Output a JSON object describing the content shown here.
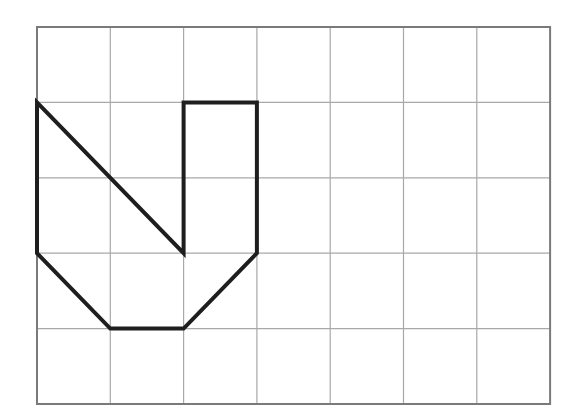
{
  "grid": {
    "columns": 7,
    "rows": 5,
    "origin_px": [
      37,
      27
    ],
    "cell_w": 73.3,
    "cell_h": 75.4,
    "line_color": "#a8a8a8",
    "border_color": "#7a7a7a"
  },
  "shape": {
    "name": "polygon",
    "stroke_color": "#1e1e1e",
    "stroke_width": 4,
    "vertices_grid": [
      [
        0,
        1
      ],
      [
        2,
        3
      ],
      [
        2,
        1
      ],
      [
        3,
        1
      ],
      [
        3,
        3
      ],
      [
        2,
        4
      ],
      [
        1,
        4
      ],
      [
        0,
        3
      ]
    ]
  }
}
